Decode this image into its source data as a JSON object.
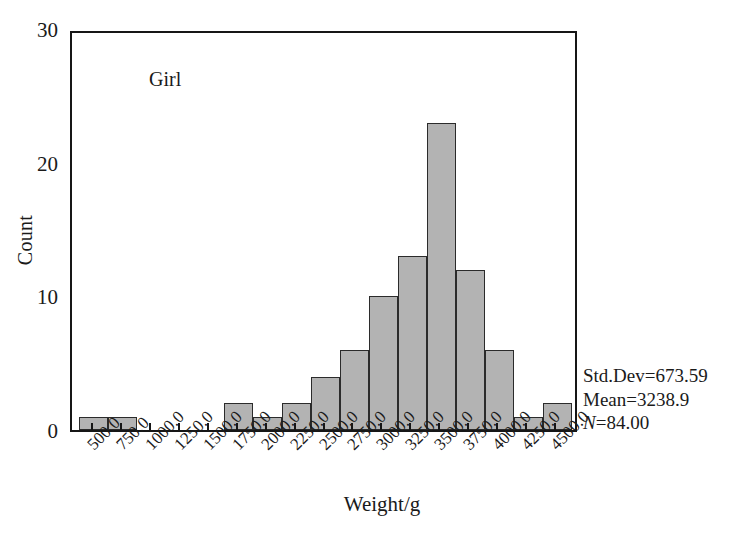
{
  "chart_data": {
    "type": "bar",
    "title": "",
    "series_label": "Girl",
    "xlabel": "Weight/g",
    "ylabel": "Count",
    "categories": [
      "500.0",
      "750.0",
      "1000.0",
      "1250.0",
      "1500.0",
      "1750.0",
      "2000.0",
      "2250.0",
      "2500.0",
      "2750.0",
      "3000.0",
      "3250.0",
      "3500.0",
      "3750.0",
      "4000.0",
      "4250.0",
      "4500.0"
    ],
    "values": [
      1,
      1,
      0,
      0,
      0,
      2,
      1,
      2,
      4,
      6,
      10,
      13,
      23,
      12,
      6,
      1,
      2
    ],
    "xlim": [
      375,
      4625
    ],
    "ylim": [
      0,
      30
    ],
    "yticks": [
      0,
      10,
      20,
      30
    ],
    "ytick_labels": [
      "0",
      "10",
      "20",
      "30"
    ],
    "bin_width": 250,
    "grid": false,
    "legend": "none",
    "bar_fill_color": "#b3b3b3",
    "bar_edge_color": "#2b2b2b",
    "axis_color": "#161616"
  },
  "annotations": {
    "std_dev": "Std.Dev=673.59",
    "mean": "Mean=3238.9",
    "n_italic": "N",
    "n_rest": "=84.00"
  }
}
